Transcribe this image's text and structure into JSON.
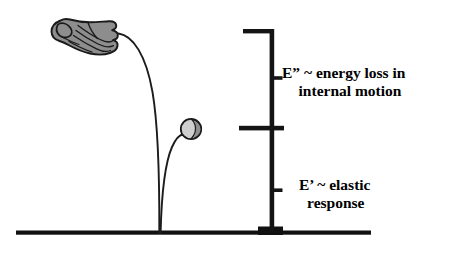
{
  "figure": {
    "colors": {
      "ink": "#141414",
      "ground": "#111111",
      "hand_fill": "#8d8d8d",
      "hand_outline": "#1a1a1a",
      "ball_fill": "#c9c9c9",
      "ball_shade": "#8f8f8f",
      "ball_outline": "#1a1a1a",
      "background": "#ffffff"
    }
  },
  "annotations": {
    "loss": {
      "line1": "E” ~ energy loss in",
      "line2": "internal motion"
    },
    "elastic": {
      "line1": "E’ ~ elastic",
      "line2": "response"
    }
  },
  "objects": {
    "hand": {
      "name": "hand-dropping-ball",
      "x": 78,
      "y": 32
    },
    "ball": {
      "name": "bouncing-ball",
      "x": 191,
      "y": 129,
      "radius": 10
    },
    "drop_trajectory": {
      "name": "drop-path",
      "from_x": 118,
      "from_y": 33,
      "to_x": 159,
      "to_y": 234
    },
    "bounce_trajectory": {
      "name": "bounce-path",
      "from_x": 160,
      "from_y": 234,
      "to_x": 182,
      "to_y": 135
    },
    "ground": {
      "name": "ground-line",
      "x1": 16,
      "x2": 371,
      "y": 234
    },
    "base_block": {
      "name": "impact-base",
      "x1": 258,
      "x2": 283,
      "y1": 228,
      "y2": 236
    }
  },
  "scale_bar": {
    "vertical_x": 272,
    "top_y": 31,
    "mid_y": 128,
    "bottom_y": 234,
    "top_arm_x": 243,
    "mid_arm_left_x": 239,
    "mid_arm_right_x": 283,
    "tick_loss_y": 78,
    "tick_elastic_y": 190
  }
}
